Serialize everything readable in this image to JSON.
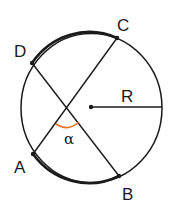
{
  "diagram": {
    "type": "circle-chords",
    "labels": {
      "A": "A",
      "B": "B",
      "C": "C",
      "D": "D",
      "radius": "R",
      "angle": "α"
    },
    "colors": {
      "stroke": "#1a1a1a",
      "angle_arc": "#e8742a",
      "background": "#ffffff"
    }
  }
}
